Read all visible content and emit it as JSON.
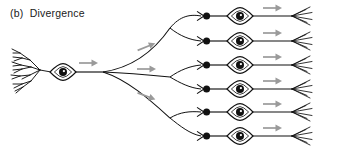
{
  "figure": {
    "panel_label": "(b)",
    "title": "Divergence",
    "caption": "(b)  Divergence",
    "type": "neuroscience-schematic",
    "width": 338,
    "height": 154,
    "background_color": "#ffffff"
  },
  "colors": {
    "ink": "#111111",
    "arrow_gray": "#9a9a9a",
    "soma_fill": "#ffffff",
    "nucleus_fill": "#111111",
    "nucleolus_fill": "#ffffff",
    "background": "#ffffff"
  },
  "source_neuron": {
    "name": "presynaptic-neuron",
    "soma_center_x": 63,
    "soma_center_y": 72,
    "soma_half_width": 12,
    "soma_half_height": 8,
    "nucleus_radius": 4.2,
    "dendrite_origin_x": 51,
    "dendrite_tip_x": 10,
    "axon_start_x": 75,
    "axon_fanout_x": 103,
    "axon_fanout_y": 72,
    "axon_arrow": {
      "x": 88,
      "y": 64,
      "direction": "right"
    }
  },
  "primary_branches": [
    {
      "id": "branch-upper",
      "end_x": 170,
      "end_y": 28,
      "arrow": {
        "x": 140,
        "y": 47,
        "direction": "right"
      }
    },
    {
      "id": "branch-middle",
      "end_x": 170,
      "end_y": 77,
      "arrow": {
        "x": 140,
        "y": 70,
        "direction": "right"
      }
    },
    {
      "id": "branch-lower",
      "end_x": 170,
      "end_y": 118,
      "arrow": {
        "x": 140,
        "y": 96,
        "direction": "right"
      }
    }
  ],
  "target_neurons": [
    {
      "index": 1,
      "row_y": 16,
      "terminal_x": 207,
      "soma_center_x": 240,
      "axon_end_x": 292,
      "arrow": {
        "x": 268,
        "y": 8
      }
    },
    {
      "index": 2,
      "row_y": 41,
      "terminal_x": 207,
      "soma_center_x": 240,
      "axon_end_x": 292,
      "arrow": {
        "x": 268,
        "y": 33
      }
    },
    {
      "index": 3,
      "row_y": 65,
      "terminal_x": 207,
      "soma_center_x": 240,
      "axon_end_x": 292,
      "arrow": {
        "x": 268,
        "y": 57
      }
    },
    {
      "index": 4,
      "row_y": 89,
      "terminal_x": 207,
      "soma_center_x": 240,
      "axon_end_x": 292,
      "arrow": {
        "x": 268,
        "y": 81
      }
    },
    {
      "index": 5,
      "row_y": 112,
      "terminal_x": 207,
      "soma_center_x": 240,
      "axon_end_x": 292,
      "arrow": {
        "x": 268,
        "y": 104
      }
    },
    {
      "index": 6,
      "row_y": 136,
      "terminal_x": 207,
      "soma_center_x": 240,
      "axon_end_x": 292,
      "arrow": {
        "x": 268,
        "y": 128
      }
    }
  ],
  "counts": {
    "source_neurons": 1,
    "primary_branches": 3,
    "target_neurons": 6,
    "synaptic_terminals": 6,
    "flow_arrows": 10
  }
}
